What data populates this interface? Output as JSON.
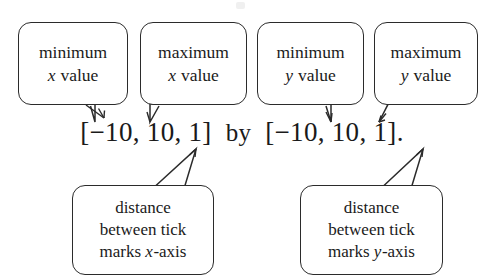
{
  "figure": {
    "expression": {
      "x_range": {
        "open_bracket": "[",
        "min": "−10",
        "sep1": ", ",
        "max": "10",
        "sep2": ", ",
        "step": "1",
        "close_bracket": "]"
      },
      "connector": "by",
      "y_range": {
        "open_bracket": "[",
        "min": "−10",
        "sep1": ", ",
        "max": "10",
        "sep2": ", ",
        "step": "1",
        "close_bracket": "]"
      },
      "terminator": ".",
      "full_text": "[−10, 10, 1]  by  [−10, 10, 1]."
    },
    "callouts": {
      "min_x": {
        "line1": "minimum",
        "line2_var": "x",
        "line2_rest": " value"
      },
      "max_x": {
        "line1": "maximum",
        "line2_var": "x",
        "line2_rest": " value"
      },
      "min_y": {
        "line1": "minimum",
        "line2_var": "y",
        "line2_rest": " value"
      },
      "max_y": {
        "line1": "maximum",
        "line2_var": "y",
        "line2_rest": " value"
      },
      "dist_x": {
        "line1": "distance",
        "line2": "between tick",
        "line3_pre": "marks ",
        "line3_var": "x",
        "line3_post": "-axis"
      },
      "dist_y": {
        "line1": "distance",
        "line2": "between tick",
        "line3_pre": "marks ",
        "line3_var": "y",
        "line3_post": "-axis"
      }
    },
    "colors": {
      "background": "#ffffff",
      "outline": "#2b2b2b",
      "text": "#1a1a1a"
    }
  }
}
